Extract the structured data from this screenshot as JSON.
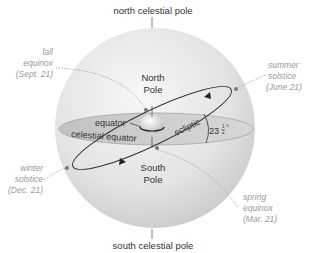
{
  "diagram": {
    "labels": {
      "north_celestial_pole": "north celestial pole",
      "south_celestial_pole": "south celestial pole",
      "north_pole_line1": "North",
      "north_pole_line2": "Pole",
      "south_pole_line1": "South",
      "south_pole_line2": "Pole",
      "equator": "equator",
      "celestial_equator": "celestial equator",
      "ecliptic": "ecliptic",
      "tilt_angle_whole": "23",
      "tilt_angle_num": "1",
      "tilt_angle_den": "2",
      "tilt_angle_deg": "°"
    },
    "events": [
      {
        "name": "fall-equinox",
        "line1": "fall",
        "line2": "equinox",
        "line3": "(Sept. 21)"
      },
      {
        "name": "summer-solstice",
        "line1": "summer",
        "line2": "solstice",
        "line3": "(June 21)"
      },
      {
        "name": "winter-solstice",
        "line1": "winter",
        "line2": "solstice",
        "line3": "(Dec. 21)"
      },
      {
        "name": "spring-equinox",
        "line1": "spring",
        "line2": "equinox",
        "line3": "(Mar. 21)"
      }
    ],
    "colors": {
      "sphere_light": "#f4f4f4",
      "sphere_dark": "#c9c9c9",
      "equator_plane": "#bdbdbd",
      "ecliptic_line": "#333333",
      "callout_text": "#9a9a9a",
      "label_text": "#333333"
    }
  }
}
